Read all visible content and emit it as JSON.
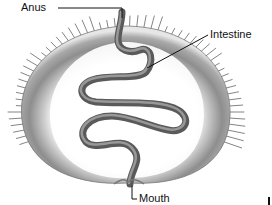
{
  "diagram": {
    "labels": {
      "anus": "Anus",
      "intestine": "Intestine",
      "mouth": "Mouth"
    },
    "colors": {
      "background": "#ffffff",
      "body_ring": "#8a8a8a",
      "spines": "#6f6f6f",
      "intestine": "#7d7d7d",
      "leader_lines": "#111111",
      "label_text": "#111111"
    }
  }
}
